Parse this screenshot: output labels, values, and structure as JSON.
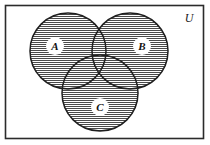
{
  "figure": {
    "name": "three-set-venn-diagram",
    "type": "venn-diagram",
    "universe": {
      "label": "U",
      "border_color": "#2b2b2b",
      "fill_color": "#ffffff"
    },
    "shading": {
      "style": "horizontal-hatch",
      "line_color": "#4a4a4a",
      "spacing_px": 2,
      "region": "union-of-all-three-sets"
    },
    "sets": [
      {
        "id": "A",
        "label": "A",
        "cx": 68,
        "cy": 51,
        "r": 38,
        "label_x": 55,
        "label_y": 49,
        "stroke": "#1f1f1f",
        "shaded": true
      },
      {
        "id": "B",
        "label": "B",
        "cx": 130,
        "cy": 51,
        "r": 38,
        "label_x": 142,
        "label_y": 49,
        "stroke": "#1f1f1f",
        "shaded": true
      },
      {
        "id": "C",
        "label": "C",
        "cx": 100,
        "cy": 93,
        "r": 38,
        "label_x": 100,
        "label_y": 111,
        "stroke": "#1f1f1f",
        "shaded": true
      }
    ],
    "universe_rect": {
      "x": 5,
      "y": 5,
      "width": 199,
      "height": 134
    },
    "universe_label_pos": {
      "x": 189,
      "y": 22
    }
  }
}
